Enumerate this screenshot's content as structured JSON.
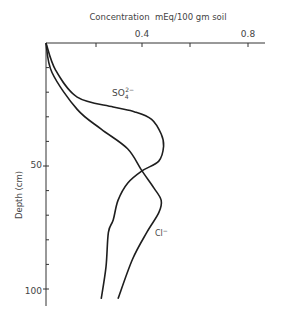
{
  "chart_data": {
    "type": "line",
    "title": "",
    "xlabel": "Concentration  mEq/100 gm soil",
    "ylabel": "Depth (cm)",
    "x_axis_position": "top",
    "y_axis_inverted": true,
    "xlim": [
      0,
      0.9
    ],
    "ylim": [
      0,
      108
    ],
    "x_ticks": [
      0.2,
      0.4,
      0.6,
      0.8
    ],
    "x_tick_labels": [
      {
        "value": 0.4,
        "label": "0.4"
      },
      {
        "value": 0.8,
        "label": "0.8"
      }
    ],
    "y_ticks": [
      10,
      20,
      30,
      40,
      50,
      60,
      70,
      80,
      90,
      100
    ],
    "y_tick_labels": [
      {
        "value": 50,
        "label": "50"
      },
      {
        "value": 100,
        "label": "100"
      }
    ],
    "grid": false,
    "legend": "inline labels",
    "series": [
      {
        "name": "SO4 2-",
        "label": "SO₄²⁻",
        "label_pos": {
          "x": 0.28,
          "y": 19
        },
        "points": [
          [
            0.0,
            0
          ],
          [
            0.04,
            11
          ],
          [
            0.13,
            22
          ],
          [
            0.28,
            26
          ],
          [
            0.37,
            28
          ],
          [
            0.44,
            31
          ],
          [
            0.48,
            37
          ],
          [
            0.49,
            42
          ],
          [
            0.47,
            48
          ],
          [
            0.4,
            52
          ],
          [
            0.34,
            57
          ],
          [
            0.3,
            64
          ],
          [
            0.28,
            72
          ],
          [
            0.26,
            77
          ],
          [
            0.25,
            91
          ],
          [
            0.23,
            104
          ]
        ]
      },
      {
        "name": "Cl-",
        "label": "Cl⁻",
        "label_pos": {
          "x": 0.45,
          "y": 77
        },
        "points": [
          [
            0.0,
            0
          ],
          [
            0.025,
            12
          ],
          [
            0.13,
            27
          ],
          [
            0.23,
            35
          ],
          [
            0.34,
            43
          ],
          [
            0.4,
            52
          ],
          [
            0.45,
            59
          ],
          [
            0.48,
            64
          ],
          [
            0.47,
            69
          ],
          [
            0.42,
            77
          ],
          [
            0.36,
            88
          ],
          [
            0.3,
            104
          ]
        ]
      }
    ]
  },
  "labels": {
    "x_axis_title": "Concentration  mEq/100 gm soil",
    "y_axis_title": "Depth (cm)",
    "x_tick_04": "0.4",
    "x_tick_08": "0.8",
    "y_tick_50": "50",
    "y_tick_100": "100",
    "so4_label": "SO",
    "so4_sub": "4",
    "so4_sup": "2−",
    "cl_label": "Cl",
    "cl_sup": "−"
  }
}
